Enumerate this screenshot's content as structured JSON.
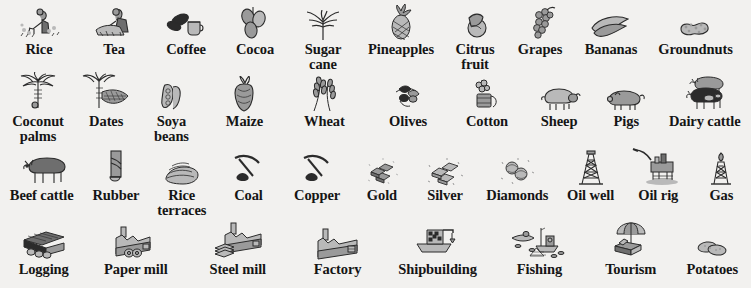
{
  "page": {
    "background_color": "#f2f1ef",
    "ink_color": "#151515",
    "style": "hand-drawn grayscale pictogram legend"
  },
  "rows": [
    {
      "name": "crops-primary",
      "items": [
        {
          "label": "Rice",
          "icon": "rice-farmer-icon",
          "width": 78
        },
        {
          "label": "Tea",
          "icon": "tea-picker-icon",
          "width": 72
        },
        {
          "label": "Coffee",
          "icon": "coffee-beans-icon",
          "width": 72
        },
        {
          "label": "Cocoa",
          "icon": "cocoa-pods-icon",
          "width": 66
        },
        {
          "label": "Sugar\ncane",
          "icon": "sugar-cane-icon",
          "width": 70
        },
        {
          "label": "Pineapples",
          "icon": "pineapple-icon",
          "width": 86
        },
        {
          "label": "Citrus\nfruit",
          "icon": "citrus-fruit-icon",
          "width": 62
        },
        {
          "label": "Grapes",
          "icon": "grapes-icon",
          "width": 68
        },
        {
          "label": "Bananas",
          "icon": "bananas-icon",
          "width": 74
        },
        {
          "label": "Groundnuts",
          "icon": "groundnuts-icon",
          "width": 95
        }
      ]
    },
    {
      "name": "crops-secondary",
      "items": [
        {
          "label": "Coconut\npalms",
          "icon": "coconut-palm-icon",
          "width": 78
        },
        {
          "label": "Dates",
          "icon": "date-palm-icon",
          "width": 62
        },
        {
          "label": "Soya\nbeans",
          "icon": "soya-beans-icon",
          "width": 72
        },
        {
          "label": "Maize",
          "icon": "maize-cob-icon",
          "width": 78
        },
        {
          "label": "Wheat",
          "icon": "wheat-ears-icon",
          "width": 86
        },
        {
          "label": "Olives",
          "icon": "olives-icon",
          "width": 86
        },
        {
          "label": "Cotton",
          "icon": "cotton-bale-icon",
          "width": 76
        },
        {
          "label": "Sheep",
          "icon": "sheep-icon",
          "width": 72
        },
        {
          "label": "Pigs",
          "icon": "pig-icon",
          "width": 66
        },
        {
          "label": "Dairy cattle",
          "icon": "dairy-cattle-icon",
          "width": 95
        }
      ]
    },
    {
      "name": "livestock-minerals",
      "items": [
        {
          "label": "Beef cattle",
          "icon": "beef-cattle-icon",
          "width": 90
        },
        {
          "label": "Rubber",
          "icon": "rubber-tree-icon",
          "width": 70
        },
        {
          "label": "Rice\nterraces",
          "icon": "rice-terraces-icon",
          "width": 72
        },
        {
          "label": "Coal",
          "icon": "pickaxe-coal-icon",
          "width": 72
        },
        {
          "label": "Copper",
          "icon": "pickaxe-ore-icon",
          "width": 76
        },
        {
          "label": "Gold",
          "icon": "gold-ingots-icon",
          "width": 64
        },
        {
          "label": "Silver",
          "icon": "silver-ingots-icon",
          "width": 72
        },
        {
          "label": "Diamonds",
          "icon": "diamonds-icon",
          "width": 84
        },
        {
          "label": "Oil well",
          "icon": "oil-derrick-icon",
          "width": 74
        },
        {
          "label": "Oil rig",
          "icon": "oil-rig-icon",
          "width": 72
        },
        {
          "label": "Gas",
          "icon": "gas-flare-icon",
          "width": 64
        }
      ]
    },
    {
      "name": "industry",
      "items": [
        {
          "label": "Logging",
          "icon": "logs-stack-icon",
          "width": 90
        },
        {
          "label": "Paper mill",
          "icon": "paper-mill-icon",
          "width": 100
        },
        {
          "label": "Steel mill",
          "icon": "steel-mill-icon",
          "width": 110
        },
        {
          "label": "Factory",
          "icon": "factory-icon",
          "width": 96
        },
        {
          "label": "Shipbuilding",
          "icon": "shipbuilding-icon",
          "width": 110
        },
        {
          "label": "Fishing",
          "icon": "fishing-boat-icon",
          "width": 100
        },
        {
          "label": "Tourism",
          "icon": "tourism-parasol-icon",
          "width": 88
        },
        {
          "label": "Potatoes",
          "icon": "potatoes-icon",
          "width": 80
        }
      ]
    }
  ]
}
